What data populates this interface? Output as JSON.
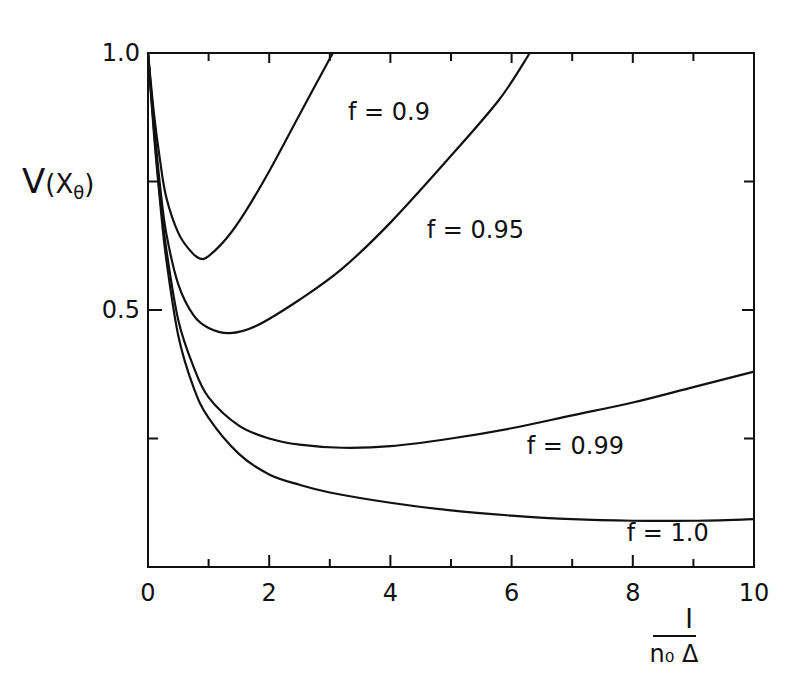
{
  "chart_data": {
    "type": "line",
    "title": "",
    "xlabel": "I / (n0 Δ)",
    "xlabel_numerator": "I",
    "xlabel_denominator": "n₀ Δ",
    "ylabel": "V(Xθ)",
    "ylabel_main": "V",
    "ylabel_paren_open": "(X",
    "ylabel_sub": "θ",
    "ylabel_paren_close": ")",
    "xlim": [
      0,
      10
    ],
    "ylim": [
      0,
      1.0
    ],
    "x_ticks_major": [
      0,
      2,
      4,
      6,
      8,
      10
    ],
    "x_ticks_minor": [
      1,
      3,
      5,
      7,
      9
    ],
    "x_tick_labels": [
      "0",
      "2",
      "4",
      "6",
      "8",
      "10"
    ],
    "y_ticks_major": [
      0.5,
      1.0
    ],
    "y_ticks_minor": [
      0.25,
      0.75
    ],
    "y_tick_labels": [
      "0.5",
      "1.0"
    ],
    "grid": false,
    "legend": "inline labels",
    "series": [
      {
        "name": "f = 0.9",
        "label": "f = 0.9",
        "x": [
          0,
          0.1,
          0.2,
          0.3,
          0.5,
          0.7,
          0.86,
          1.0,
          1.3,
          1.6,
          2.0,
          2.5,
          3.05
        ],
        "y": [
          1.0,
          0.88,
          0.79,
          0.72,
          0.65,
          0.615,
          0.6,
          0.605,
          0.64,
          0.69,
          0.77,
          0.88,
          1.0
        ]
      },
      {
        "name": "f = 0.95",
        "label": "f = 0.95",
        "x": [
          0,
          0.1,
          0.2,
          0.3,
          0.5,
          0.75,
          1.0,
          1.35,
          1.8,
          2.5,
          3.2,
          4.0,
          5.0,
          5.8,
          6.3
        ],
        "y": [
          1.0,
          0.86,
          0.74,
          0.65,
          0.55,
          0.49,
          0.465,
          0.455,
          0.47,
          0.52,
          0.58,
          0.67,
          0.8,
          0.91,
          1.0
        ]
      },
      {
        "name": "f = 0.99",
        "label": "f = 0.99",
        "x": [
          0,
          0.1,
          0.2,
          0.3,
          0.5,
          0.75,
          1.0,
          1.5,
          2.0,
          2.5,
          3.2,
          4.0,
          5.0,
          6.0,
          7.0,
          8.0,
          9.0,
          10.0
        ],
        "y": [
          1.0,
          0.85,
          0.72,
          0.62,
          0.48,
          0.39,
          0.33,
          0.275,
          0.25,
          0.238,
          0.232,
          0.235,
          0.25,
          0.27,
          0.295,
          0.32,
          0.35,
          0.38
        ]
      },
      {
        "name": "f = 1.0",
        "label": "f = 1.0",
        "x": [
          0,
          0.1,
          0.2,
          0.3,
          0.5,
          0.75,
          1.0,
          1.5,
          2.0,
          2.5,
          3.0,
          4.0,
          5.0,
          6.0,
          7.0,
          8.0,
          9.0,
          10.0
        ],
        "y": [
          1.0,
          0.84,
          0.71,
          0.6,
          0.45,
          0.35,
          0.29,
          0.22,
          0.18,
          0.16,
          0.145,
          0.125,
          0.11,
          0.1,
          0.093,
          0.09,
          0.09,
          0.093
        ]
      }
    ],
    "annotations": [
      {
        "text": "f = 0.9",
        "x": 3.3,
        "y": 0.87
      },
      {
        "text": "f = 0.95",
        "x": 4.6,
        "y": 0.64
      },
      {
        "text": "f = 0.99",
        "x": 6.25,
        "y": 0.22
      },
      {
        "text": "f = 1.0",
        "x": 7.9,
        "y": 0.05
      }
    ]
  }
}
